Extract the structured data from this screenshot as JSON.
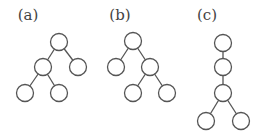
{
  "diagram": {
    "type": "tree-figures",
    "node_radius": 8.5,
    "colors": {
      "stroke": "#555555",
      "fill": "#ffffff",
      "label": "#444444"
    },
    "panels": [
      {
        "label": "(a)",
        "label_pos": [
          28,
          20
        ],
        "nodes": [
          [
            59,
            42
          ],
          [
            43,
            67
          ],
          [
            78,
            67
          ],
          [
            25,
            93
          ],
          [
            59,
            93
          ]
        ],
        "edges": [
          [
            0,
            1
          ],
          [
            0,
            2
          ],
          [
            1,
            3
          ],
          [
            1,
            4
          ]
        ]
      },
      {
        "label": "(b)",
        "label_pos": [
          120,
          20
        ],
        "nodes": [
          [
            133,
            41
          ],
          [
            116,
            67
          ],
          [
            150,
            67
          ],
          [
            133,
            93
          ],
          [
            167,
            93
          ]
        ],
        "edges": [
          [
            0,
            1
          ],
          [
            0,
            2
          ],
          [
            2,
            3
          ],
          [
            2,
            4
          ]
        ]
      },
      {
        "label": "(c)",
        "label_pos": [
          207,
          20
        ],
        "nodes": [
          [
            223,
            43
          ],
          [
            223,
            67
          ],
          [
            223,
            93
          ],
          [
            206,
            121
          ],
          [
            241,
            121
          ]
        ],
        "edges": [
          [
            0,
            1
          ],
          [
            1,
            2
          ],
          [
            2,
            3
          ],
          [
            2,
            4
          ]
        ]
      }
    ]
  }
}
